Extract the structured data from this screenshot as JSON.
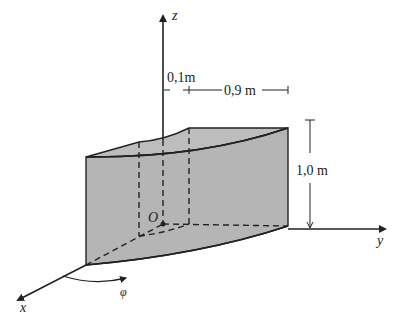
{
  "figure": {
    "axes": {
      "x": "x",
      "y": "y",
      "z": "z"
    },
    "origin_label": "O",
    "angle_label": "φ",
    "dimensions": {
      "inner_radius": "0,1m",
      "radial_width": "0,9 m",
      "height": "1,0 m"
    },
    "colors": {
      "fill": "#b5b5b5",
      "stroke": "#222222",
      "background": "#ffffff"
    }
  }
}
